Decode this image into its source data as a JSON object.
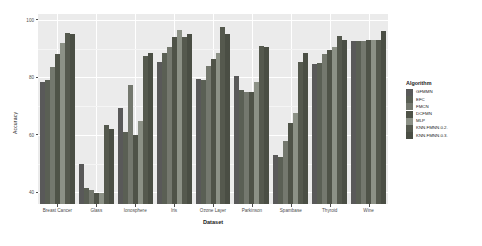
{
  "chart_data": {
    "type": "bar",
    "title": "",
    "xlabel": "Dataset",
    "ylabel": "Accuracy",
    "ylim": [
      36,
      102
    ],
    "yticks": [
      40,
      60,
      80,
      100
    ],
    "grid": true,
    "legend_position": "right",
    "legend_title": "Algorithm",
    "categories": [
      "Breast Cancer",
      "Glass",
      "Ionosphere",
      "Iris",
      "Ozone Layer",
      "Parkinson",
      "Spambase",
      "Thyroid",
      "Wine"
    ],
    "series": [
      {
        "name": "GFMMN",
        "color": "#595959",
        "values": [
          78.5,
          50.0,
          69.5,
          85.5,
          79.5,
          80.5,
          53.0,
          84.5,
          92.5
        ]
      },
      {
        "name": "EFC",
        "color": "#5a5f54",
        "values": [
          79.0,
          41.5,
          61.0,
          88.5,
          79.0,
          75.5,
          52.5,
          85.0,
          92.5
        ]
      },
      {
        "name": "FMCN",
        "color": "#74786e",
        "values": [
          83.5,
          41.0,
          77.5,
          90.5,
          84.0,
          75.0,
          58.0,
          88.0,
          92.5
        ]
      },
      {
        "name": "DCFMN",
        "color": "#4f5348",
        "values": [
          88.0,
          40.0,
          60.0,
          94.0,
          86.5,
          75.0,
          64.0,
          89.5,
          93.0
        ]
      },
      {
        "name": "MLP",
        "color": "#8c9186",
        "values": [
          92.0,
          40.0,
          65.0,
          96.5,
          88.5,
          78.5,
          67.5,
          90.5,
          93.0
        ]
      },
      {
        "name": "KNN.FMNN.0.2.",
        "color": "#55594e",
        "values": [
          95.5,
          63.5,
          87.5,
          94.0,
          97.5,
          91.0,
          85.5,
          94.5,
          93.0
        ]
      },
      {
        "name": "KNN.FMNN.0.3.",
        "color": "#4a4e44",
        "values": [
          95.0,
          62.0,
          88.5,
          95.0,
          95.0,
          90.5,
          88.5,
          93.0,
          96.0
        ]
      }
    ]
  }
}
